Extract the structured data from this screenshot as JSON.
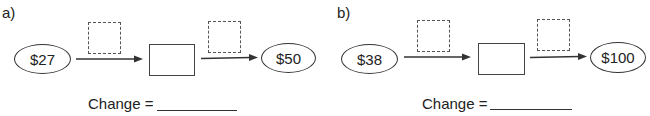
{
  "problems": [
    {
      "label": "a)",
      "start_value": "$27",
      "end_value": "$50",
      "change_label": "Change ="
    },
    {
      "label": "b)",
      "start_value": "$38",
      "end_value": "$100",
      "change_label": "Change ="
    }
  ]
}
